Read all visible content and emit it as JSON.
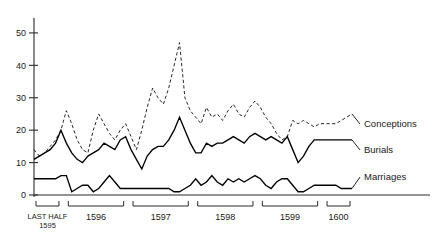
{
  "chart_data": {
    "type": "line",
    "title": "",
    "xlabel": "",
    "ylabel": "",
    "ylim": [
      0,
      55
    ],
    "yticks": [
      0,
      10,
      20,
      30,
      40,
      50
    ],
    "grid": false,
    "legend_position": "right-inline",
    "x_period_groups": [
      {
        "label_line1": "LAST HALF",
        "label_line2": "1595",
        "months": 6
      },
      {
        "label_line1": "1596",
        "label_line2": "",
        "months": 12
      },
      {
        "label_line1": "1597",
        "label_line2": "",
        "months": 12
      },
      {
        "label_line1": "1598",
        "label_line2": "",
        "months": 12
      },
      {
        "label_line1": "1599",
        "label_line2": "",
        "months": 12
      },
      {
        "label_line1": "1600",
        "label_line2": "",
        "months": 12
      }
    ],
    "series": [
      {
        "name": "Conceptions",
        "style": "dashed",
        "values": [
          14,
          12,
          13,
          15,
          17,
          20,
          26,
          22,
          17,
          14,
          13,
          20,
          25,
          22,
          19,
          17,
          20,
          22,
          18,
          14,
          20,
          27,
          33,
          30,
          28,
          33,
          40,
          47,
          30,
          26,
          24,
          22,
          27,
          24,
          25,
          23,
          26,
          28,
          25,
          24,
          27,
          29,
          27,
          24,
          22,
          19,
          17,
          18,
          23,
          22,
          23,
          22,
          21,
          22,
          22,
          22,
          22,
          23,
          24,
          25
        ]
      },
      {
        "name": "Burials",
        "style": "solid",
        "values": [
          11,
          12,
          13,
          14,
          16,
          20,
          16,
          13,
          11,
          10,
          12,
          13,
          14,
          16,
          15,
          14,
          17,
          18,
          14,
          11,
          8,
          12,
          14,
          15,
          15,
          17,
          20,
          24,
          20,
          16,
          13,
          13,
          16,
          15,
          16,
          16,
          17,
          18,
          17,
          16,
          18,
          19,
          18,
          17,
          18,
          17,
          16,
          18,
          14,
          10,
          12,
          15,
          17,
          17,
          17,
          17,
          17,
          17,
          17,
          17
        ]
      },
      {
        "name": "Marriages",
        "style": "solid",
        "values": [
          5,
          5,
          5,
          5,
          5,
          6,
          6,
          1,
          2,
          3,
          3,
          1,
          2,
          4,
          6,
          4,
          2,
          2,
          2,
          2,
          2,
          2,
          2,
          2,
          2,
          2,
          1,
          1,
          2,
          3,
          5,
          3,
          4,
          6,
          4,
          3,
          5,
          4,
          5,
          4,
          5,
          6,
          5,
          3,
          2,
          4,
          5,
          5,
          3,
          1,
          1,
          2,
          3,
          3,
          3,
          3,
          3,
          2,
          2,
          2
        ]
      }
    ],
    "fill_note": "black area marks months where burials exceed conceptions"
  },
  "labels": {
    "conceptions": "Conceptions",
    "burials": "Burials",
    "marriages": "Marriages"
  },
  "colors": {
    "ink": "#000000",
    "axis": "#2b2b2b",
    "background": "#ffffff"
  }
}
